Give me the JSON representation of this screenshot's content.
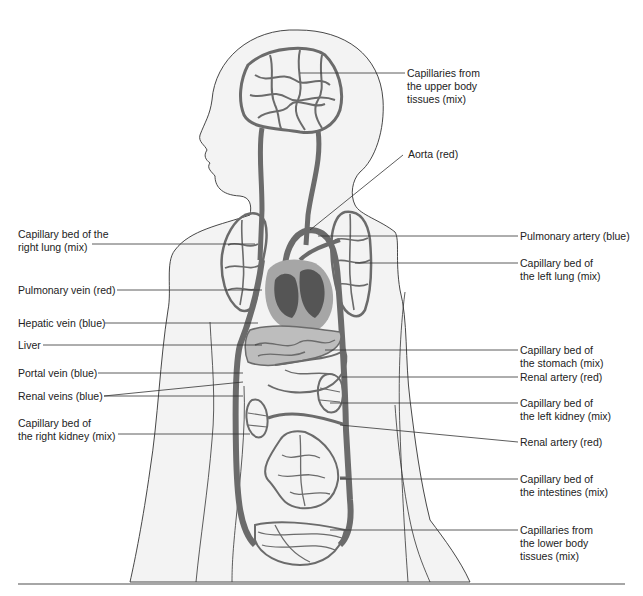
{
  "diagram": {
    "colors": {
      "body_fill": "#f2f2f2",
      "outline": "#333333",
      "vessel": "#6b6b6b",
      "heart_dark": "#555555",
      "heart_light": "#a6a6a6",
      "liver": "#bdbdbd",
      "leader_line": "#333333"
    },
    "labels_left": [
      {
        "text": "Capillary bed of the\nright lung (mix)"
      },
      {
        "text": "Pulmonary vein (red)"
      },
      {
        "text": "Hepatic vein (blue)"
      },
      {
        "text": "Liver"
      },
      {
        "text": "Portal vein (blue)"
      },
      {
        "text": "Renal veins (blue)"
      },
      {
        "text": "Capillary bed of\nthe right kidney (mix)"
      }
    ],
    "labels_right": [
      {
        "text": "Capillaries from\nthe upper body\ntissues (mix)"
      },
      {
        "text": "Aorta (red)"
      },
      {
        "text": "Pulmonary artery (blue)"
      },
      {
        "text": "Capillary bed of\nthe left lung (mix)"
      },
      {
        "text": "Capillary bed of\nthe stomach (mix)"
      },
      {
        "text": "Renal artery (red)"
      },
      {
        "text": "Capillary bed of\nthe left kidney (mix)"
      },
      {
        "text": "Renal artery (red)"
      },
      {
        "text": "Capillary bed of\nthe intestines (mix)"
      },
      {
        "text": "Capillaries from\nthe lower body\ntissues (mix)"
      }
    ]
  }
}
